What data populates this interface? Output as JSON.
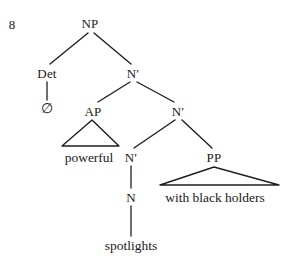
{
  "figure": {
    "example_number": "8",
    "type": "syntactic-phrase-structure-tree",
    "stroke_color": "#1f1f1f",
    "text_color": "#1a1a1a",
    "background_color": "#ffffff"
  },
  "nodes": {
    "np": {
      "label": "NP",
      "x": 90,
      "y": 23
    },
    "det": {
      "label": "Det",
      "x": 47,
      "y": 73
    },
    "nbar_top": {
      "label": "N′",
      "x": 133,
      "y": 73
    },
    "ap": {
      "label": "AP",
      "x": 93,
      "y": 111
    },
    "nbar_mid": {
      "label": "N′",
      "x": 178,
      "y": 111
    },
    "nbar_low": {
      "label": "N′",
      "x": 131,
      "y": 157
    },
    "pp": {
      "label": "PP",
      "x": 214,
      "y": 157
    },
    "n_head": {
      "label": "N",
      "x": 131,
      "y": 197
    }
  },
  "terminals": {
    "det_null": {
      "label": "∅",
      "x": 47,
      "y": 109
    },
    "ap_words": {
      "label": "powerful",
      "x": 89,
      "y": 158
    },
    "pp_words": {
      "label": "with black holders",
      "x": 215,
      "y": 198
    },
    "n_word": {
      "label": "spotlights",
      "x": 131,
      "y": 246
    }
  },
  "edges": [
    {
      "name": "np-to-det",
      "from": "NP",
      "to": "Det",
      "x1": 88,
      "y1": 33,
      "x2": 50,
      "y2": 64
    },
    {
      "name": "np-to-nbar-top",
      "from": "NP",
      "to": "N′",
      "x1": 94,
      "y1": 33,
      "x2": 131,
      "y2": 64
    },
    {
      "name": "det-to-null",
      "from": "Det",
      "to": "∅",
      "x1": 47,
      "y1": 82,
      "x2": 47,
      "y2": 100
    },
    {
      "name": "nbar-top-to-ap",
      "from": "N′",
      "to": "AP",
      "x1": 130,
      "y1": 82,
      "x2": 98,
      "y2": 102
    },
    {
      "name": "nbar-top-to-nbar-mid",
      "from": "N′",
      "to": "N′",
      "x1": 137,
      "y1": 82,
      "x2": 174,
      "y2": 102
    },
    {
      "name": "nbar-mid-to-nbar-low",
      "from": "N′",
      "to": "N′",
      "x1": 175,
      "y1": 120,
      "x2": 134,
      "y2": 148
    },
    {
      "name": "nbar-mid-to-pp",
      "from": "N′",
      "to": "PP",
      "x1": 182,
      "y1": 120,
      "x2": 212,
      "y2": 148
    },
    {
      "name": "nbar-low-to-n",
      "from": "N′",
      "to": "N",
      "x1": 131,
      "y1": 166,
      "x2": 131,
      "y2": 188
    },
    {
      "name": "n-to-spotlights",
      "from": "N",
      "to": "spotlights",
      "x1": 131,
      "y1": 206,
      "x2": 131,
      "y2": 236
    }
  ],
  "triangles": [
    {
      "name": "ap-triangle",
      "apex_x": 92,
      "apex_y": 120,
      "left_x": 62,
      "right_x": 119,
      "base_y": 146
    },
    {
      "name": "pp-triangle",
      "apex_x": 214,
      "apex_y": 167,
      "left_x": 160,
      "right_x": 279,
      "base_y": 185
    }
  ]
}
